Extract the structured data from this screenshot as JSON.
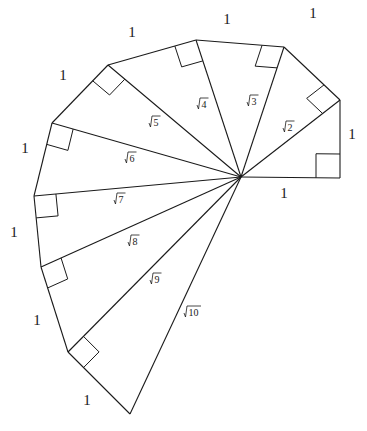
{
  "center": [
    241,
    177
  ],
  "vertices": [
    [
      340,
      178
    ],
    [
      340,
      100
    ],
    [
      284,
      47
    ],
    [
      196,
      40
    ],
    [
      108,
      65
    ],
    [
      52,
      123
    ],
    [
      34,
      196
    ],
    [
      41,
      267
    ],
    [
      68,
      352
    ],
    [
      130,
      414
    ]
  ],
  "unit_labels": [
    {
      "text": "1",
      "x": 284,
      "y": 198
    },
    {
      "text": "1",
      "x": 352,
      "y": 139
    },
    {
      "text": "1",
      "x": 313,
      "y": 18
    },
    {
      "text": "1",
      "x": 227,
      "y": 24
    },
    {
      "text": "1",
      "x": 132,
      "y": 37
    },
    {
      "text": "1",
      "x": 63,
      "y": 80
    },
    {
      "text": "1",
      "x": 25,
      "y": 153
    },
    {
      "text": "1",
      "x": 14,
      "y": 237
    },
    {
      "text": "1",
      "x": 37,
      "y": 325
    },
    {
      "text": "1",
      "x": 87,
      "y": 405
    }
  ],
  "radical_labels": [
    {
      "text": "2",
      "x": 286,
      "y": 131
    },
    {
      "text": "3",
      "x": 250,
      "y": 105
    },
    {
      "text": "4",
      "x": 200,
      "y": 108
    },
    {
      "text": "5",
      "x": 152,
      "y": 126
    },
    {
      "text": "6",
      "x": 128,
      "y": 162
    },
    {
      "text": "7",
      "x": 117,
      "y": 203
    },
    {
      "text": "8",
      "x": 131,
      "y": 245
    },
    {
      "text": "9",
      "x": 153,
      "y": 283
    },
    {
      "text": "10",
      "x": 187,
      "y": 316
    }
  ]
}
